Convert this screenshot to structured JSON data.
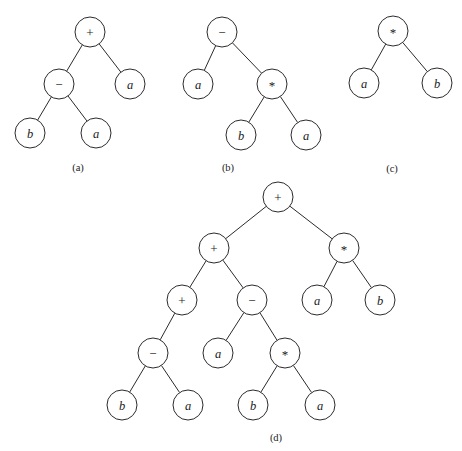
{
  "figure": {
    "background_color": "#ffffff",
    "stroke_color": "#2b2b2b",
    "text_color": "#1a1a1a",
    "width": 462,
    "height": 451,
    "node_radius": 15
  },
  "panels": [
    {
      "caption": "(a)",
      "caption_x": 78,
      "caption_y": 167,
      "nodes": [
        {
          "id": "a0",
          "label": "+",
          "kind": "operator",
          "x": 90,
          "y": 32
        },
        {
          "id": "a1",
          "label": "−",
          "kind": "operator",
          "x": 59,
          "y": 84
        },
        {
          "id": "a2",
          "label": "a",
          "kind": "operand",
          "x": 130,
          "y": 84
        },
        {
          "id": "a3",
          "label": "b",
          "kind": "operand",
          "x": 30,
          "y": 133
        },
        {
          "id": "a4",
          "label": "a",
          "kind": "operand",
          "x": 96,
          "y": 133
        }
      ],
      "edges": [
        {
          "from": "a0",
          "to": "a1"
        },
        {
          "from": "a0",
          "to": "a2"
        },
        {
          "from": "a1",
          "to": "a3"
        },
        {
          "from": "a1",
          "to": "a4"
        }
      ]
    },
    {
      "caption": "(b)",
      "caption_x": 228,
      "caption_y": 167,
      "nodes": [
        {
          "id": "b0",
          "label": "−",
          "kind": "operator",
          "x": 222,
          "y": 32
        },
        {
          "id": "b1",
          "label": "a",
          "kind": "operand",
          "x": 198,
          "y": 84
        },
        {
          "id": "b2",
          "label": "*",
          "kind": "operator",
          "x": 272,
          "y": 84
        },
        {
          "id": "b3",
          "label": "b",
          "kind": "operand",
          "x": 241,
          "y": 135
        },
        {
          "id": "b4",
          "label": "a",
          "kind": "operand",
          "x": 306,
          "y": 135
        }
      ],
      "edges": [
        {
          "from": "b0",
          "to": "b1"
        },
        {
          "from": "b0",
          "to": "b2"
        },
        {
          "from": "b2",
          "to": "b3"
        },
        {
          "from": "b2",
          "to": "b4"
        }
      ]
    },
    {
      "caption": "(c)",
      "caption_x": 392,
      "caption_y": 168,
      "nodes": [
        {
          "id": "c0",
          "label": "*",
          "kind": "operator",
          "x": 393,
          "y": 31
        },
        {
          "id": "c1",
          "label": "a",
          "kind": "operand",
          "x": 364,
          "y": 83
        },
        {
          "id": "c2",
          "label": "b",
          "kind": "operand",
          "x": 437,
          "y": 83
        }
      ],
      "edges": [
        {
          "from": "c0",
          "to": "c1"
        },
        {
          "from": "c0",
          "to": "c2"
        }
      ]
    },
    {
      "caption": "(d)",
      "caption_x": 276,
      "caption_y": 437,
      "nodes": [
        {
          "id": "d0",
          "label": "+",
          "kind": "operator",
          "x": 278,
          "y": 197
        },
        {
          "id": "d1",
          "label": "+",
          "kind": "operator",
          "x": 214,
          "y": 248
        },
        {
          "id": "d2",
          "label": "*",
          "kind": "operator",
          "x": 344,
          "y": 248
        },
        {
          "id": "d3",
          "label": "+",
          "kind": "operator",
          "x": 182,
          "y": 300
        },
        {
          "id": "d4",
          "label": "−",
          "kind": "operator",
          "x": 252,
          "y": 300
        },
        {
          "id": "d5",
          "label": "a",
          "kind": "operand",
          "x": 317,
          "y": 300
        },
        {
          "id": "d6",
          "label": "b",
          "kind": "operand",
          "x": 380,
          "y": 300
        },
        {
          "id": "d7",
          "label": "−",
          "kind": "operator",
          "x": 153,
          "y": 353
        },
        {
          "id": "d8",
          "label": "a",
          "kind": "operand",
          "x": 218,
          "y": 353
        },
        {
          "id": "d9",
          "label": "*",
          "kind": "operator",
          "x": 285,
          "y": 353
        },
        {
          "id": "d10",
          "label": "b",
          "kind": "operand",
          "x": 122,
          "y": 405
        },
        {
          "id": "d11",
          "label": "a",
          "kind": "operand",
          "x": 188,
          "y": 405
        },
        {
          "id": "d12",
          "label": "b",
          "kind": "operand",
          "x": 253,
          "y": 405
        },
        {
          "id": "d13",
          "label": "a",
          "kind": "operand",
          "x": 320,
          "y": 405
        }
      ],
      "edges": [
        {
          "from": "d0",
          "to": "d1"
        },
        {
          "from": "d0",
          "to": "d2"
        },
        {
          "from": "d1",
          "to": "d3"
        },
        {
          "from": "d1",
          "to": "d4"
        },
        {
          "from": "d2",
          "to": "d5"
        },
        {
          "from": "d2",
          "to": "d6"
        },
        {
          "from": "d3",
          "to": "d7"
        },
        {
          "from": "d4",
          "to": "d8"
        },
        {
          "from": "d4",
          "to": "d9"
        },
        {
          "from": "d7",
          "to": "d10"
        },
        {
          "from": "d7",
          "to": "d11"
        },
        {
          "from": "d9",
          "to": "d12"
        },
        {
          "from": "d9",
          "to": "d13"
        }
      ]
    }
  ]
}
